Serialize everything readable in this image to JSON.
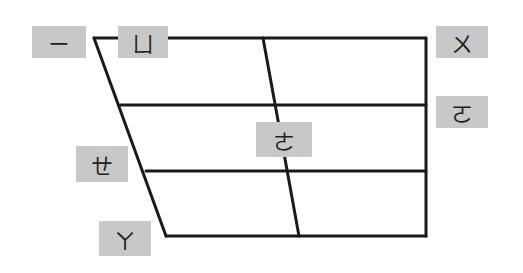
{
  "colors": {
    "line": "#1a1a1a",
    "label_bg": "#c8c8c8",
    "label_text": "#222222"
  },
  "labels": [
    {
      "id": "i",
      "symbol": "ㄧ",
      "x": 32,
      "y": 26,
      "w": 54,
      "h": 32
    },
    {
      "id": "yu",
      "symbol": "ㄩ",
      "x": 118,
      "y": 26,
      "w": 50,
      "h": 32
    },
    {
      "id": "u",
      "symbol": "ㄨ",
      "x": 436,
      "y": 26,
      "w": 52,
      "h": 32
    },
    {
      "id": "o",
      "symbol": "ㄛ",
      "x": 436,
      "y": 96,
      "w": 52,
      "h": 32
    },
    {
      "id": "e",
      "symbol": "ㄜ",
      "x": 256,
      "y": 122,
      "w": 56,
      "h": 35
    },
    {
      "id": "eh",
      "symbol": "ㄝ",
      "x": 76,
      "y": 146,
      "w": 52,
      "h": 36
    },
    {
      "id": "a",
      "symbol": "ㄚ",
      "x": 99,
      "y": 221,
      "w": 52,
      "h": 35
    }
  ]
}
